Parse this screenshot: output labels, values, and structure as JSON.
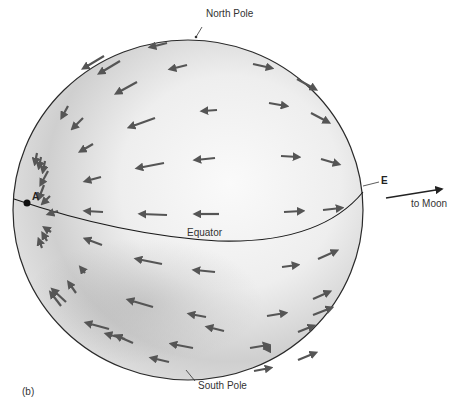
{
  "labels": {
    "north_pole": "North Pole",
    "south_pole": "South Pole",
    "equator": "Equator",
    "point_a": "A",
    "point_e": "E",
    "to_moon": "to Moon",
    "panel": "(b)"
  },
  "colors": {
    "sphere_outline": "#2a2a2a",
    "arrow": "#555555",
    "equator_line": "#1a1a1a",
    "shade_light": "#f7f7f7",
    "shade_dark": "#b5b5b5"
  },
  "arrows": [
    {
      "x1": 104,
      "y1": 56,
      "x2": 84,
      "y2": 68
    },
    {
      "x1": 120,
      "y1": 61,
      "x2": 100,
      "y2": 73
    },
    {
      "x1": 167,
      "y1": 43,
      "x2": 151,
      "y2": 47
    },
    {
      "x1": 137,
      "y1": 82,
      "x2": 117,
      "y2": 93
    },
    {
      "x1": 187,
      "y1": 65,
      "x2": 171,
      "y2": 69
    },
    {
      "x1": 68,
      "y1": 106,
      "x2": 62,
      "y2": 117
    },
    {
      "x1": 83,
      "y1": 118,
      "x2": 73,
      "y2": 128
    },
    {
      "x1": 155,
      "y1": 118,
      "x2": 130,
      "y2": 127
    },
    {
      "x1": 217,
      "y1": 110,
      "x2": 203,
      "y2": 111
    },
    {
      "x1": 253,
      "y1": 64,
      "x2": 271,
      "y2": 68
    },
    {
      "x1": 297,
      "y1": 79,
      "x2": 315,
      "y2": 89
    },
    {
      "x1": 269,
      "y1": 103,
      "x2": 286,
      "y2": 106
    },
    {
      "x1": 311,
      "y1": 113,
      "x2": 328,
      "y2": 122
    },
    {
      "x1": 93,
      "y1": 144,
      "x2": 81,
      "y2": 151
    },
    {
      "x1": 164,
      "y1": 163,
      "x2": 138,
      "y2": 168
    },
    {
      "x1": 215,
      "y1": 158,
      "x2": 196,
      "y2": 160
    },
    {
      "x1": 281,
      "y1": 156,
      "x2": 298,
      "y2": 157
    },
    {
      "x1": 321,
      "y1": 159,
      "x2": 338,
      "y2": 164
    },
    {
      "x1": 101,
      "y1": 177,
      "x2": 86,
      "y2": 181
    },
    {
      "x1": 103,
      "y1": 212,
      "x2": 86,
      "y2": 211
    },
    {
      "x1": 167,
      "y1": 215,
      "x2": 141,
      "y2": 214
    },
    {
      "x1": 219,
      "y1": 214,
      "x2": 196,
      "y2": 214
    },
    {
      "x1": 284,
      "y1": 212,
      "x2": 302,
      "y2": 211
    },
    {
      "x1": 323,
      "y1": 210,
      "x2": 341,
      "y2": 208
    },
    {
      "x1": 44,
      "y1": 185,
      "x2": 39,
      "y2": 198
    },
    {
      "x1": 48,
      "y1": 171,
      "x2": 41,
      "y2": 184
    },
    {
      "x1": 50,
      "y1": 196,
      "x2": 43,
      "y2": 203
    },
    {
      "x1": 58,
      "y1": 211,
      "x2": 49,
      "y2": 214
    },
    {
      "x1": 37,
      "y1": 153,
      "x2": 35,
      "y2": 163
    },
    {
      "x1": 41,
      "y1": 157,
      "x2": 39,
      "y2": 167
    },
    {
      "x1": 45,
      "y1": 161,
      "x2": 43,
      "y2": 171
    },
    {
      "x1": 51,
      "y1": 232,
      "x2": 45,
      "y2": 228
    },
    {
      "x1": 47,
      "y1": 241,
      "x2": 43,
      "y2": 234
    },
    {
      "x1": 42,
      "y1": 248,
      "x2": 39,
      "y2": 240
    },
    {
      "x1": 102,
      "y1": 245,
      "x2": 86,
      "y2": 239
    },
    {
      "x1": 162,
      "y1": 264,
      "x2": 137,
      "y2": 259
    },
    {
      "x1": 215,
      "y1": 272,
      "x2": 195,
      "y2": 270
    },
    {
      "x1": 85,
      "y1": 273,
      "x2": 81,
      "y2": 268
    },
    {
      "x1": 76,
      "y1": 293,
      "x2": 69,
      "y2": 283
    },
    {
      "x1": 66,
      "y1": 302,
      "x2": 53,
      "y2": 290
    },
    {
      "x1": 61,
      "y1": 306,
      "x2": 51,
      "y2": 293
    },
    {
      "x1": 153,
      "y1": 307,
      "x2": 129,
      "y2": 300
    },
    {
      "x1": 206,
      "y1": 317,
      "x2": 190,
      "y2": 314
    },
    {
      "x1": 109,
      "y1": 329,
      "x2": 87,
      "y2": 323
    },
    {
      "x1": 125,
      "y1": 339,
      "x2": 107,
      "y2": 334
    },
    {
      "x1": 282,
      "y1": 267,
      "x2": 297,
      "y2": 265
    },
    {
      "x1": 318,
      "y1": 259,
      "x2": 336,
      "y2": 251
    },
    {
      "x1": 313,
      "y1": 315,
      "x2": 331,
      "y2": 308
    },
    {
      "x1": 313,
      "y1": 299,
      "x2": 329,
      "y2": 292
    },
    {
      "x1": 267,
      "y1": 316,
      "x2": 285,
      "y2": 313
    },
    {
      "x1": 133,
      "y1": 343,
      "x2": 117,
      "y2": 336
    },
    {
      "x1": 193,
      "y1": 348,
      "x2": 172,
      "y2": 344
    },
    {
      "x1": 250,
      "y1": 348,
      "x2": 268,
      "y2": 345
    },
    {
      "x1": 169,
      "y1": 362,
      "x2": 152,
      "y2": 358
    },
    {
      "x1": 224,
      "y1": 331,
      "x2": 208,
      "y2": 327
    },
    {
      "x1": 267,
      "y1": 349,
      "x2": 266,
      "y2": 349
    },
    {
      "x1": 298,
      "y1": 332,
      "x2": 313,
      "y2": 326
    },
    {
      "x1": 298,
      "y1": 360,
      "x2": 315,
      "y2": 353
    },
    {
      "x1": 254,
      "y1": 371,
      "x2": 270,
      "y2": 368
    }
  ]
}
